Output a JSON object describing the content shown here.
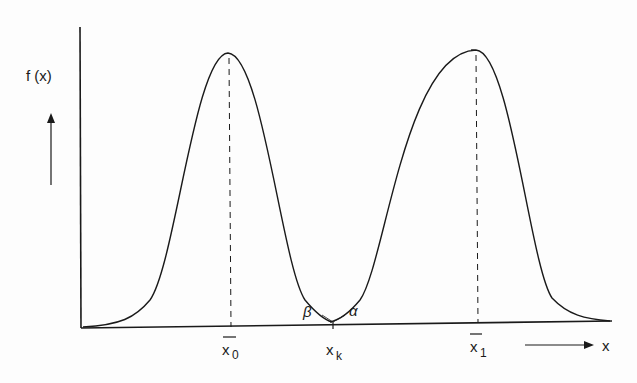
{
  "diagram": {
    "y_axis_label": "f (x)",
    "x_axis_label": "x",
    "tick_labels": {
      "x0": "x",
      "x0_sub": "0",
      "xk": "x",
      "xk_sub": "k",
      "x1": "x",
      "x1_sub": "1"
    },
    "annotations": {
      "beta": "β",
      "alpha": "α"
    },
    "curves": [
      {
        "name": "distribution-0",
        "mean_label": "x̄0",
        "peak_x_px": 228
      },
      {
        "name": "distribution-1",
        "mean_label": "x̄1",
        "peak_x_px": 476
      }
    ],
    "colors": {
      "ink": "#1a1a1a",
      "background": "#fdfdfd"
    }
  }
}
